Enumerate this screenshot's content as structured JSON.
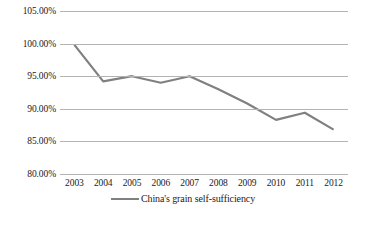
{
  "chart_data": {
    "type": "line",
    "title": "",
    "subtitle": "",
    "xlabel": "",
    "ylabel": "",
    "categories": [
      "2003",
      "2004",
      "2005",
      "2006",
      "2007",
      "2008",
      "2009",
      "2010",
      "2011",
      "2012"
    ],
    "series": [
      {
        "name": "China's grain self-sufficiency",
        "color": "#808080",
        "values": [
          99.8,
          94.2,
          95.0,
          94.0,
          95.0,
          93.0,
          90.8,
          88.3,
          89.4,
          86.8
        ]
      }
    ],
    "ylim": [
      80.0,
      105.0
    ],
    "ytick_values": [
      105.0,
      100.0,
      95.0,
      90.0,
      85.0,
      80.0
    ],
    "ytick_labels": [
      "105.00%",
      "100.00%",
      "95.00%",
      "90.00%",
      "85.00%",
      "80.00%"
    ],
    "xtick_labels": [
      "2003",
      "2004",
      "2005",
      "2006",
      "2007",
      "2008",
      "2009",
      "2010",
      "2011",
      "2012"
    ],
    "grid": true,
    "grid_axis": "y",
    "grid_color": "#b3b3b3",
    "legend": {
      "position": "bottom",
      "entries": [
        {
          "label": "China's grain self-sufficiency",
          "color": "#808080"
        }
      ]
    },
    "background": "#ffffff",
    "markers": false,
    "line_width": 2.2
  }
}
